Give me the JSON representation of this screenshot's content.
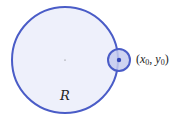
{
  "diagram": {
    "region": {
      "label": "R",
      "cx": 65,
      "cy": 60,
      "r": 53,
      "fill": "#eef0fb",
      "stroke": "#4a5cc7"
    },
    "neighborhood": {
      "cx": 119,
      "cy": 60,
      "r": 11,
      "fill": "#c5cbef",
      "stroke": "#4a5cc7"
    },
    "point": {
      "label_open": "(",
      "x_var": "x",
      "x_sub": "0",
      "sep": ", ",
      "y_var": "y",
      "y_sub": "0",
      "label_close": ")",
      "cx": 119,
      "cy": 60,
      "color": "#3347b8"
    },
    "center_mark": {
      "cx": 65,
      "cy": 60
    }
  }
}
